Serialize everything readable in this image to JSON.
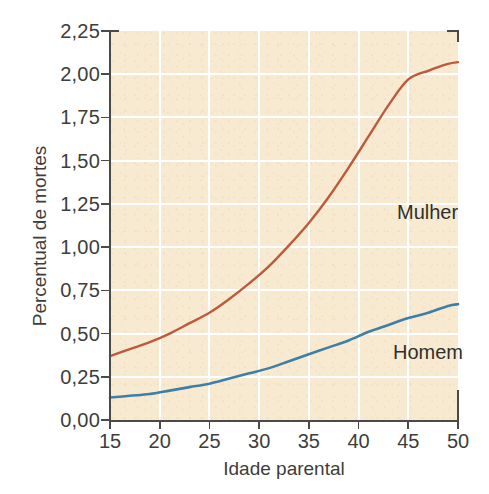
{
  "chart_data": {
    "type": "line",
    "title": "",
    "subtitle": "",
    "xlabel": "Idade parental",
    "ylabel": "Percentual de mortes",
    "xlim": [
      15,
      50
    ],
    "ylim": [
      0.0,
      2.25
    ],
    "xticks": [
      15,
      20,
      25,
      30,
      35,
      40,
      45,
      50
    ],
    "xtick_labels": [
      "15",
      "20",
      "25",
      "30",
      "35",
      "40",
      "45",
      "50"
    ],
    "yticks": [
      0.0,
      0.25,
      0.5,
      0.75,
      1.0,
      1.25,
      1.5,
      1.75,
      2.0,
      2.25
    ],
    "ytick_labels": [
      "0,00",
      "0,25",
      "0,50",
      "0,75",
      "1,00",
      "1,25",
      "1,50",
      "1,75",
      "2,00",
      "2,25"
    ],
    "grid": true,
    "grid_color": "#ffffff",
    "plot_background": "#f7ead0",
    "legend": "inline-annotations",
    "legend_position": "inside-plot",
    "x": [
      15,
      17,
      19,
      21,
      23,
      25,
      27,
      29,
      31,
      33,
      35,
      37,
      39,
      41,
      43,
      45,
      47,
      49,
      50
    ],
    "series": [
      {
        "name": "Mulher",
        "color": "#bd5a3e",
        "annotation": "Mulher",
        "values": [
          0.37,
          0.41,
          0.45,
          0.5,
          0.56,
          0.62,
          0.7,
          0.79,
          0.89,
          1.01,
          1.14,
          1.29,
          1.46,
          1.64,
          1.82,
          1.97,
          2.02,
          2.06,
          2.07
        ]
      },
      {
        "name": "Homem",
        "color": "#3e7fa6",
        "annotation": "Homem",
        "values": [
          0.13,
          0.14,
          0.15,
          0.17,
          0.19,
          0.21,
          0.24,
          0.27,
          0.3,
          0.34,
          0.38,
          0.42,
          0.46,
          0.51,
          0.55,
          0.59,
          0.62,
          0.66,
          0.67
        ]
      }
    ]
  },
  "axes": {
    "y_title": "Percentual de mortes",
    "x_title": "Idade parental"
  },
  "annotations": {
    "mulher": "Mulher",
    "homem": "Homem"
  }
}
